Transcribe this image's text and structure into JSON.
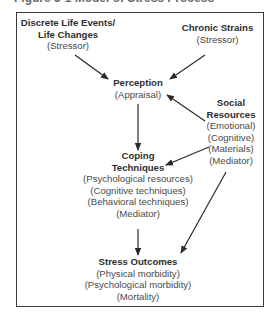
{
  "figure": {
    "caption": "Figure 3-1  Model of Stress Process"
  },
  "nodes": {
    "life_events": {
      "title_lines": [
        "Discrete Life Events/",
        "Life Changes"
      ],
      "sub_lines": [
        "(Stressor)"
      ]
    },
    "chronic_strains": {
      "title_lines": [
        "Chronic Strains"
      ],
      "sub_lines": [
        "(Stressor)"
      ]
    },
    "perception": {
      "title_lines": [
        "Perception"
      ],
      "sub_lines": [
        "(Appraisal)"
      ]
    },
    "social_resources": {
      "title_lines": [
        "Social",
        "Resources"
      ],
      "sub_lines": [
        "(Emotional)",
        "(Cognitive)",
        "(Materials)",
        "(Mediator)"
      ]
    },
    "coping": {
      "title_lines": [
        "Coping",
        "Techniques"
      ],
      "sub_lines": [
        "(Psychological resources)",
        "(Cognitive techniques)",
        "(Behavioral techniques)",
        "(Mediator)"
      ]
    },
    "outcomes": {
      "title_lines": [
        "Stress Outcomes"
      ],
      "sub_lines": [
        "(Physical morbidity)",
        "(Psychological morbidity)",
        "(Mortality)"
      ]
    }
  },
  "edges": [
    {
      "from": "Discrete Life Events/Life Changes",
      "to": "Perception"
    },
    {
      "from": "Chronic Strains",
      "to": "Perception"
    },
    {
      "from": "Social Resources",
      "to": "Perception"
    },
    {
      "from": "Perception",
      "to": "Coping Techniques"
    },
    {
      "from": "Social Resources",
      "to": "Coping Techniques"
    },
    {
      "from": "Coping Techniques",
      "to": "Stress Outcomes"
    },
    {
      "from": "Social Resources",
      "to": "Stress Outcomes"
    }
  ],
  "colors": {
    "border": "#3a3a3a",
    "arrow": "#2a2a2a",
    "title_text": "#2e2e2e",
    "sub_text": "#4a4a4a"
  }
}
